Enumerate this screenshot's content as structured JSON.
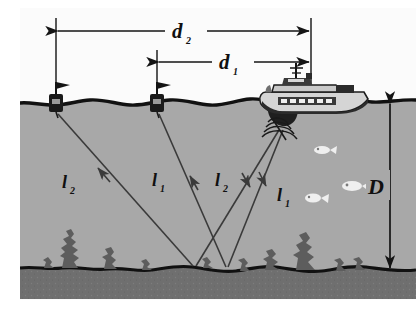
{
  "figure": {
    "colors": {
      "page_background": "#ffffff",
      "water": "#a8a8a8",
      "sky": "#fbfbfb",
      "seabed_sediment": "#6f6f6f",
      "seabed_line": "#111111",
      "surface_line": "#111111",
      "vegetation": "#5d5d5d",
      "ray": "#3a3a3a",
      "buoy_body": "#1a1a1a",
      "ship_hull": "#d0d0d0",
      "ship_dark": "#2b2b2b",
      "fish": "#efefef",
      "label_text": "#101010"
    }
  },
  "dimensions": {
    "d2": {
      "label": "d",
      "subscript": "2",
      "name": "distance-buoy-left-to-ship"
    },
    "d1": {
      "label": "d",
      "subscript": "1",
      "name": "distance-buoy-right-to-ship"
    },
    "depth": {
      "label": "D",
      "subscript": "",
      "name": "water-depth"
    }
  },
  "rays": [
    {
      "label": "l",
      "subscript": "2",
      "name": "ray-l2-left-return"
    },
    {
      "label": "l",
      "subscript": "1",
      "name": "ray-l1-left-return"
    },
    {
      "label": "l",
      "subscript": "2",
      "name": "ray-l2-outgoing"
    },
    {
      "label": "l",
      "subscript": "1",
      "name": "ray-l1-outgoing"
    }
  ],
  "objects": {
    "ship": "survey-ship",
    "buoy_left": "marker-buoy-left",
    "buoy_right": "marker-buoy-right",
    "transducer": "sonar-transducer",
    "fish_count": 3
  }
}
